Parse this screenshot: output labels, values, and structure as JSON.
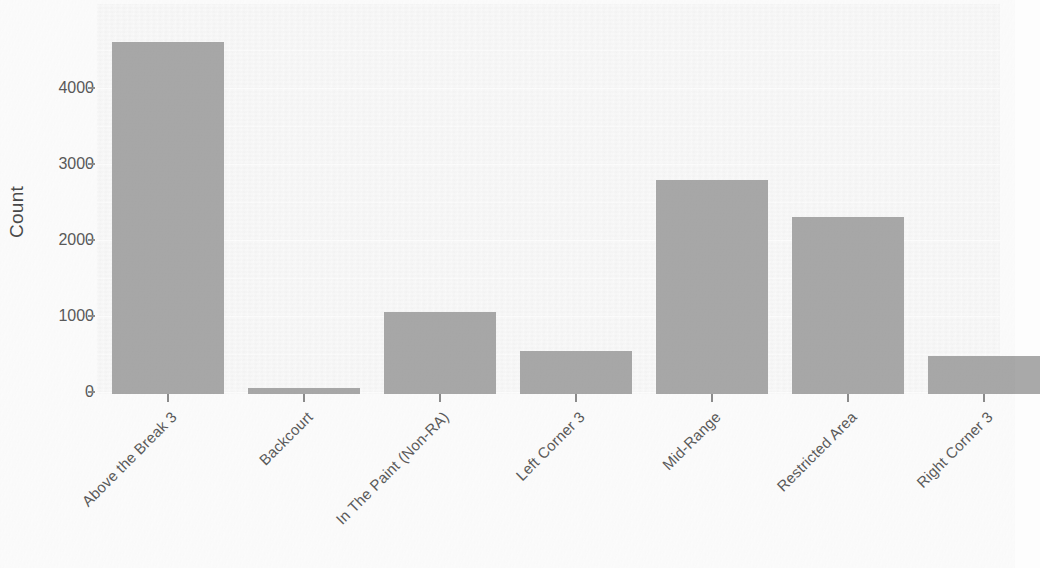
{
  "chart_data": {
    "type": "bar",
    "title": "",
    "xlabel": "",
    "ylabel": "Count",
    "categories": [
      "Above the Break 3",
      "Backcourt",
      "In The Paint (Non-RA)",
      "Left Corner 3",
      "Mid-Range",
      "Restricted Area",
      "Right Corner 3"
    ],
    "values": [
      4760,
      80,
      1105,
      580,
      2900,
      2390,
      515
    ],
    "ylim": [
      0,
      4900
    ],
    "yticks": [
      0,
      1000,
      2000,
      3000,
      4000
    ],
    "ytick_labels": [
      "0",
      "1000",
      "2000",
      "3000",
      "4000"
    ],
    "grid": true,
    "legend": "none",
    "bar_color": "#a9a9a9",
    "panel_color": "#f4f4f4",
    "axis_text_color": "#5a5a5a"
  }
}
